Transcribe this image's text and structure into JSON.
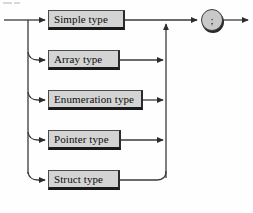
{
  "diagram": {
    "kind": "railroad-syntax-diagram",
    "colors": {
      "box_fill": "#d4d4d4",
      "box_border": "#4a4a4a",
      "box_shadow": "#1a1a1a",
      "line": "#3a3a3a",
      "text": "#0d0d0d",
      "background": "#fefefe"
    },
    "entry": {
      "name": "entry-arrow",
      "label": ""
    },
    "alternatives": [
      {
        "id": "simple-type",
        "label": "Simple type",
        "x": 48,
        "y": 10,
        "width": 77,
        "height": 20
      },
      {
        "id": "array-type",
        "label": "Array type",
        "x": 48,
        "y": 50,
        "width": 72,
        "height": 20
      },
      {
        "id": "enumeration-type",
        "label": "Enumeration type",
        "x": 48,
        "y": 90,
        "width": 95,
        "height": 20
      },
      {
        "id": "pointer-type",
        "label": "Pointer type",
        "x": 48,
        "y": 130,
        "width": 73,
        "height": 20
      },
      {
        "id": "struct-type",
        "label": "Struct type",
        "x": 48,
        "y": 170,
        "width": 72,
        "height": 20
      }
    ],
    "terminal": {
      "id": "semicolon-terminal",
      "label": ";",
      "cx": 212,
      "cy": 20,
      "r": 11
    },
    "exit": {
      "name": "exit-arrow",
      "label": ""
    }
  }
}
